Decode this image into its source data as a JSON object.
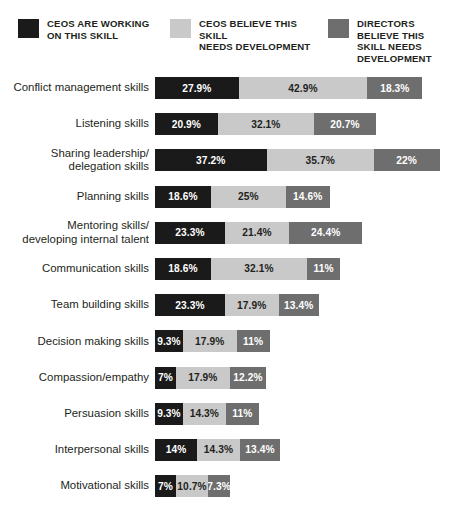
{
  "legend": {
    "items": [
      {
        "label": "CEOs are working\non this skill",
        "color": "#1a1a1a",
        "swatch_name": "legend-swatch-ceos-working"
      },
      {
        "label": "CEOs believe this skill\nneeds development",
        "color": "#c9c9c9",
        "swatch_name": "legend-swatch-ceos-believe"
      },
      {
        "label": "Directors believe this\nskill needs development",
        "color": "#6e6e6e",
        "swatch_name": "legend-swatch-directors-believe"
      }
    ]
  },
  "colors": {
    "series_1": "#1a1a1a",
    "series_2": "#c9c9c9",
    "series_3": "#6e6e6e",
    "background": "#ffffff",
    "text": "#231f20"
  },
  "chart_data": {
    "type": "bar",
    "title": "",
    "subtitle": "",
    "xlabel": "",
    "ylabel": "",
    "orientation": "horizontal",
    "stacked": true,
    "grid": false,
    "legend_position": "top",
    "xlim": [
      0,
      95
    ],
    "categories": [
      "Conflict management skills",
      "Listening skills",
      "Sharing leadership/\ndelegation skills",
      "Planning skills",
      "Mentoring skills/\ndeveloping internal talent",
      "Communication skills",
      "Team building skills",
      "Decision making skills",
      "Compassion/empathy",
      "Persuasion skills",
      "Interpersonal skills",
      "Motivational skills"
    ],
    "series": [
      {
        "name": "CEOs are working on this skill",
        "color": "#1a1a1a",
        "values": [
          27.9,
          20.9,
          37.2,
          18.6,
          23.3,
          18.6,
          23.3,
          9.3,
          7,
          9.3,
          14,
          7
        ],
        "labels": [
          "27.9%",
          "20.9%",
          "37.2%",
          "18.6%",
          "23.3%",
          "18.6%",
          "23.3%",
          "9.3%",
          "7%",
          "9.3%",
          "14%",
          "7%"
        ]
      },
      {
        "name": "CEOs believe this skill needs development",
        "color": "#c9c9c9",
        "values": [
          42.9,
          32.1,
          35.7,
          25,
          21.4,
          32.1,
          17.9,
          17.9,
          17.9,
          14.3,
          14.3,
          10.7
        ],
        "labels": [
          "42.9%",
          "32.1%",
          "35.7%",
          "25%",
          "21.4%",
          "32.1%",
          "17.9%",
          "17.9%",
          "17.9%",
          "14.3%",
          "14.3%",
          "10.7%"
        ]
      },
      {
        "name": "Directors believe this skill needs development",
        "color": "#6e6e6e",
        "values": [
          18.3,
          20.7,
          22,
          14.6,
          24.4,
          11,
          13.4,
          11,
          12.2,
          11,
          13.4,
          7.3
        ],
        "labels": [
          "18.3%",
          "20.7%",
          "22%",
          "14.6%",
          "24.4%",
          "11%",
          "13.4%",
          "11%",
          "12.2%",
          "11%",
          "13.4%",
          "7.3%"
        ]
      }
    ]
  }
}
